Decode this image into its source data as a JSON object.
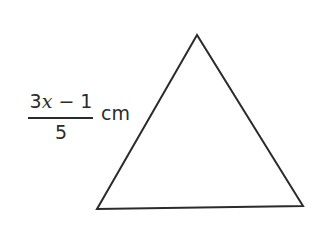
{
  "diagram": {
    "shape": "triangle",
    "vertices": {
      "apex": [
        197,
        35
      ],
      "bottom_left": [
        97,
        209
      ],
      "bottom_right": [
        303,
        206
      ]
    },
    "stroke_color": "#2b2b2b",
    "fill_color": "#ffffff",
    "side_label": {
      "side": "left",
      "numerator_coef": "3",
      "numerator_var": "x",
      "numerator_rest": " − 1",
      "denominator": "5",
      "unit": "cm"
    }
  }
}
